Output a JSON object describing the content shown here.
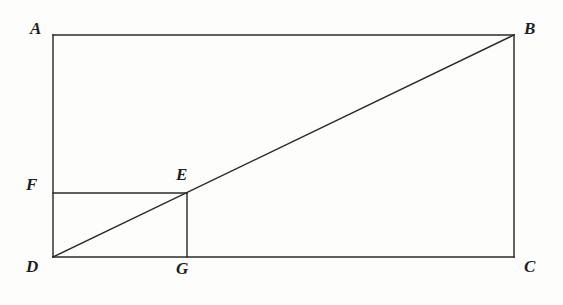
{
  "figure": {
    "type": "geometry-diagram",
    "background_color": "#fdfdfc",
    "stroke_color": "#2a2a2a",
    "stroke_width": 1.45,
    "canvas": {
      "width": 563,
      "height": 305
    },
    "points": {
      "A": {
        "label": "A",
        "x": 53,
        "y": 35,
        "label_x": 30,
        "label_y": 20
      },
      "B": {
        "label": "B",
        "x": 514,
        "y": 35,
        "label_x": 524,
        "label_y": 20
      },
      "C": {
        "label": "C",
        "x": 514,
        "y": 257,
        "label_x": 524,
        "label_y": 258
      },
      "D": {
        "label": "D",
        "x": 53,
        "y": 257,
        "label_x": 26,
        "label_y": 258
      },
      "E": {
        "label": "E",
        "x": 187,
        "y": 193,
        "label_x": 176,
        "label_y": 166
      },
      "F": {
        "label": "F",
        "x": 53,
        "y": 193,
        "label_x": 26,
        "label_y": 176
      },
      "G": {
        "label": "G",
        "x": 187,
        "y": 257,
        "label_x": 176,
        "label_y": 260
      }
    },
    "segments": [
      {
        "name": "side-AB",
        "from": "A",
        "to": "B"
      },
      {
        "name": "side-BC",
        "from": "B",
        "to": "C"
      },
      {
        "name": "side-CD",
        "from": "C",
        "to": "D"
      },
      {
        "name": "side-DA",
        "from": "D",
        "to": "A"
      },
      {
        "name": "diagonal-DB",
        "from": "D",
        "to": "B"
      },
      {
        "name": "segment-FE",
        "from": "F",
        "to": "E"
      },
      {
        "name": "segment-EG",
        "from": "E",
        "to": "G"
      }
    ]
  }
}
